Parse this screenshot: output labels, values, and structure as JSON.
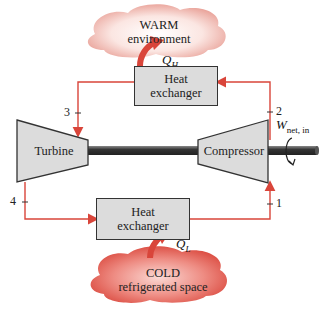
{
  "diagram": {
    "warm_cloud": {
      "line1": "WARM",
      "line2": "environment"
    },
    "cold_cloud": {
      "line1": "COLD",
      "line2": "refrigerated space"
    },
    "heat_exchanger_top": {
      "line1": "Heat",
      "line2": "exchanger"
    },
    "heat_exchanger_bottom": {
      "line1": "Heat",
      "line2": "exchanger"
    },
    "turbine_label": "Turbine",
    "compressor_label": "Compressor",
    "heat_out": {
      "symbol": "Q",
      "subscript": "H"
    },
    "heat_in": {
      "symbol": "Q",
      "subscript": "L"
    },
    "work": {
      "symbol": "W",
      "subscript": "net, in"
    },
    "states": [
      "1",
      "2",
      "3",
      "4"
    ],
    "colors": {
      "flow_line": "#d9453a",
      "component_fill": "#dcdcdc",
      "shaft": "#444444",
      "cloud_warm": "#f3b7ae",
      "cloud_cold": "#e0615a"
    }
  }
}
